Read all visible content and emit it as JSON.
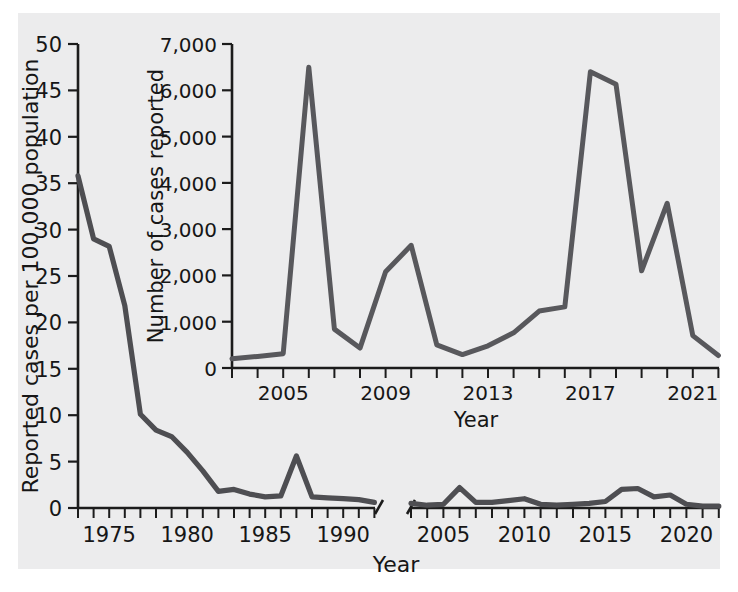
{
  "chart_data": [
    {
      "id": "main",
      "type": "line",
      "title": "",
      "xlabel": "Year",
      "ylabel": "Reported cases per 100,000 population",
      "ylim": [
        0,
        50
      ],
      "ytick_labels": [
        "0",
        "5",
        "10",
        "15",
        "20",
        "25",
        "30",
        "35",
        "40",
        "45",
        "50"
      ],
      "ytick_values": [
        0,
        5,
        10,
        15,
        20,
        25,
        30,
        35,
        40,
        45,
        50
      ],
      "xtick_labels": [
        "1975",
        "1980",
        "1985",
        "1990",
        "2005",
        "2010",
        "2015",
        "2020"
      ],
      "grid": false,
      "axis_break": true,
      "axis_break_note": "x-axis broken between 1992 and 2003",
      "series": [
        {
          "name": "segment-1973-1992",
          "x": [
            1973,
            1974,
            1975,
            1976,
            1977,
            1978,
            1979,
            1980,
            1981,
            1982,
            1983,
            1984,
            1985,
            1986,
            1987,
            1988,
            1989,
            1990,
            1991,
            1992
          ],
          "values": [
            35.8,
            29.0,
            28.2,
            21.8,
            10.1,
            8.4,
            7.7,
            6.0,
            4.0,
            1.8,
            2.0,
            1.5,
            1.2,
            1.3,
            5.6,
            1.2,
            1.1,
            1.0,
            0.9,
            0.6
          ]
        },
        {
          "name": "segment-2003-2022",
          "x": [
            2003,
            2004,
            2005,
            2006,
            2007,
            2008,
            2009,
            2010,
            2011,
            2012,
            2013,
            2014,
            2015,
            2016,
            2017,
            2018,
            2019,
            2020,
            2021,
            2022
          ],
          "values": [
            0.5,
            0.3,
            0.4,
            2.2,
            0.6,
            0.6,
            0.8,
            1.0,
            0.4,
            0.3,
            0.4,
            0.5,
            0.7,
            2.0,
            2.1,
            1.2,
            1.4,
            0.4,
            0.2,
            0.2
          ]
        }
      ]
    },
    {
      "id": "inset",
      "type": "line",
      "title": "",
      "xlabel": "Year",
      "ylabel": "Number of cases reported",
      "ylim": [
        0,
        7000
      ],
      "ytick_labels": [
        "0",
        "1,000",
        "2,000",
        "3,000",
        "4,000",
        "5,000",
        "6,000",
        "7,000"
      ],
      "ytick_values": [
        0,
        1000,
        2000,
        3000,
        4000,
        5000,
        6000,
        7000
      ],
      "xtick_labels": [
        "2005",
        "2009",
        "2013",
        "2017",
        "2021"
      ],
      "xtick_values": [
        2005,
        2009,
        2013,
        2017,
        2021
      ],
      "grid": false,
      "series": [
        {
          "name": "cases-reported",
          "x": [
            2003,
            2004,
            2005,
            2006,
            2007,
            2008,
            2009,
            2010,
            2011,
            2012,
            2013,
            2014,
            2015,
            2016,
            2017,
            2018,
            2019,
            2020,
            2021,
            2022
          ],
          "values": [
            200,
            250,
            310,
            6500,
            840,
            430,
            2080,
            2650,
            500,
            290,
            480,
            760,
            1230,
            1320,
            6400,
            6130,
            2100,
            3560,
            700,
            270,
            380
          ]
        }
      ]
    }
  ],
  "main_axis": {
    "y_title": "Reported cases per 100,000 population",
    "x_title": "Year",
    "y_ticks": [
      "50",
      "45",
      "40",
      "35",
      "30",
      "25",
      "20",
      "15",
      "10",
      "5",
      "0"
    ],
    "x_ticks_left": [
      "1975",
      "1980",
      "1985",
      "1990"
    ],
    "x_ticks_right": [
      "2005",
      "2010",
      "2015",
      "2020"
    ]
  },
  "inset_axis": {
    "y_title": "Number of cases reported",
    "x_title": "Year",
    "y_ticks": [
      "7,000",
      "6,000",
      "5,000",
      "4,000",
      "3,000",
      "2,000",
      "1,000",
      "0"
    ],
    "x_ticks": [
      "2005",
      "2009",
      "2013",
      "2017",
      "2021"
    ]
  },
  "colors": {
    "background": "#ececed",
    "page": "#ffffff",
    "line": "#4e4e52",
    "axis": "#1c1c1c",
    "text": "#161616"
  }
}
